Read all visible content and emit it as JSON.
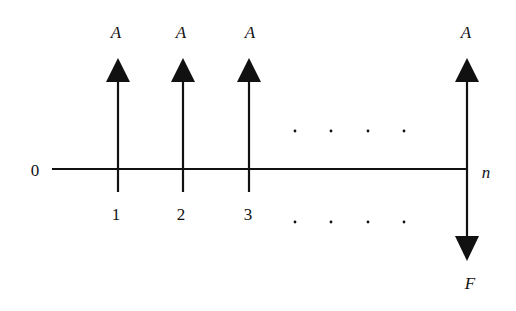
{
  "diagram": {
    "type": "cash-flow-timeline",
    "origin_label": "0",
    "end_label": "n",
    "ellipsis": ". . . .",
    "periods": [
      {
        "index": "1",
        "x": 118,
        "flow_label": "A",
        "direction": "up"
      },
      {
        "index": "2",
        "x": 183,
        "flow_label": "A",
        "direction": "up"
      },
      {
        "index": "3",
        "x": 249,
        "flow_label": "A",
        "direction": "up"
      }
    ],
    "final_period": {
      "x": 467,
      "up_label": "A",
      "down_label": "F"
    },
    "colors": {
      "line": "#111111",
      "background": "#ffffff"
    }
  }
}
